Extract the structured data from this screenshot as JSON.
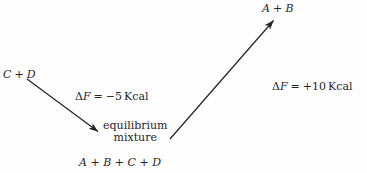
{
  "diagram": {
    "title_present": false,
    "background_color": "#fefefe",
    "ink_color": "#262626",
    "reactants_left": {
      "name": "C + D",
      "sym1": "C",
      "op": "+",
      "sym2": "D"
    },
    "products_top": {
      "name": "A + B",
      "sym1": "A",
      "op": "+",
      "sym2": "B"
    },
    "equilibrium": {
      "line1": "equilibrium",
      "line2": "mixture",
      "species": "A + B + C + D",
      "sym1": "A",
      "op1": "+",
      "sym2": "B",
      "op2": "+",
      "sym3": "C",
      "op3": "+",
      "sym4": "D"
    },
    "annotation_down": {
      "name": "delta-F-forward",
      "delta": "Δ",
      "f": "F",
      "equals": "=",
      "value": "−5",
      "unit": "Kcal",
      "full": "ΔF = −5 Kcal"
    },
    "annotation_up": {
      "name": "delta-F-reverse",
      "delta": "Δ",
      "f": "F",
      "equals": "=",
      "value": "+10",
      "unit": "Kcal",
      "full": "ΔF = +10 Kcal"
    },
    "arrows": [
      {
        "name": "arrow-cd-to-equilibrium",
        "direction": "down-right",
        "from": [
          27,
          79
        ],
        "to": [
          100,
          133
        ],
        "color": "#262626"
      },
      {
        "name": "arrow-equilibrium-to-ab",
        "direction": "up-right",
        "from": [
          170,
          139
        ],
        "to": [
          276,
          17
        ],
        "color": "#262626"
      }
    ]
  }
}
